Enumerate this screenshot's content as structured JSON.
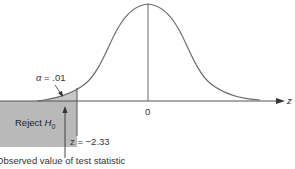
{
  "diagram": {
    "type": "standard normal distribution, left-tailed hypothesis test",
    "axis_label": "z",
    "center_label": "0",
    "alpha_label": "α = .01",
    "alpha_symbol": "α",
    "alpha_value": ".01",
    "critical_value_label": "z = −2.33",
    "critical_z": -2.33,
    "reject_region_label": "Reject",
    "reject_region_subject": "H",
    "reject_region_subscript": "0",
    "observed_label": "Observed value of test statistic",
    "colors": {
      "curve": "#6b6b6b",
      "axis": "#555555",
      "reject_box": "#b9b9b9",
      "tail_shade": "#c8c8c8",
      "text": "#333333"
    }
  }
}
